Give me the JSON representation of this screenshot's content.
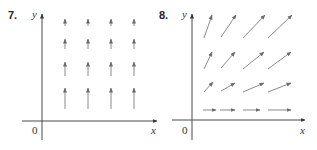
{
  "colors": {
    "axis": "#4a4a4a",
    "arrow": "#8a8a8a",
    "text": "#333333"
  },
  "panels": [
    {
      "id": "7",
      "number_label": "7.",
      "x_label": "x",
      "y_label": "y",
      "origin_label": "0",
      "axes": {
        "origin": [
          42,
          121
        ],
        "x_from": 22,
        "x_to": 157,
        "y_from": 140,
        "y_to": 14
      },
      "arrows": [
        [
          65,
          109,
          65,
          88
        ],
        [
          88,
          109,
          88,
          88
        ],
        [
          111,
          109,
          111,
          88
        ],
        [
          134,
          109,
          134,
          88
        ],
        [
          65,
          76,
          65,
          62
        ],
        [
          88,
          76,
          88,
          62
        ],
        [
          111,
          76,
          111,
          62
        ],
        [
          134,
          76,
          134,
          62
        ],
        [
          65,
          49,
          65,
          39
        ],
        [
          88,
          49,
          88,
          39
        ],
        [
          111,
          49,
          111,
          39
        ],
        [
          134,
          49,
          134,
          39
        ],
        [
          65,
          26,
          65,
          19
        ],
        [
          88,
          26,
          88,
          19
        ],
        [
          111,
          26,
          111,
          19
        ],
        [
          134,
          26,
          134,
          19
        ]
      ]
    },
    {
      "id": "8",
      "number_label": "8.",
      "x_label": "x",
      "y_label": "y",
      "origin_label": "0",
      "axes": {
        "origin": [
          192,
          120
        ],
        "x_from": 172,
        "x_to": 305,
        "y_from": 140,
        "y_to": 14
      },
      "arrows": [
        [
          203,
          110,
          216,
          110
        ],
        [
          220,
          110,
          235,
          110
        ],
        [
          243,
          110,
          260,
          110
        ],
        [
          268,
          110,
          291,
          110
        ],
        [
          204,
          92,
          213,
          82
        ],
        [
          221,
          91,
          235,
          83
        ],
        [
          243,
          92,
          264,
          83
        ],
        [
          268,
          92,
          291,
          83
        ],
        [
          204,
          69,
          212,
          52
        ],
        [
          221,
          68,
          235,
          52
        ],
        [
          243,
          69,
          264,
          52
        ],
        [
          268,
          69,
          291,
          52
        ],
        [
          204,
          38,
          212,
          15
        ],
        [
          221,
          37,
          236,
          15
        ],
        [
          243,
          38,
          265,
          15
        ],
        [
          268,
          38,
          292,
          15
        ]
      ]
    }
  ]
}
